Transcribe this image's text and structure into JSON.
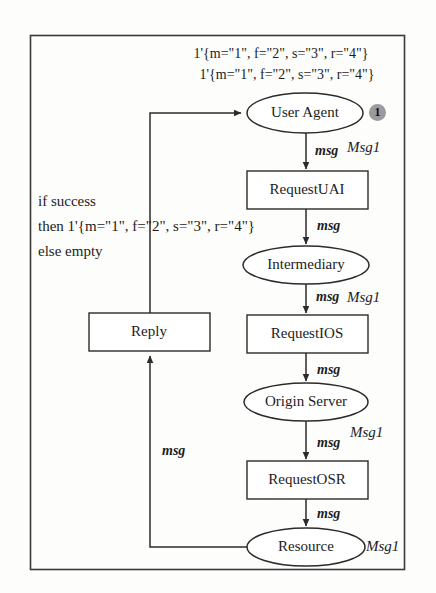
{
  "diagram": {
    "border_color": "#2a2a2a",
    "token_marker_color": "#9b9b9b",
    "initial_marking": {
      "line1": "1'{m=\"1\", f=\"2\", s=\"3\", r=\"4\"}",
      "line2": "1'{m=\"1\", f=\"2\", s=\"3\", r=\"4\"}"
    },
    "guard_annotation": {
      "line1": "if success",
      "line2": "then 1'{m=\"1\", f=\"2\", s=\"3\", r=\"4\"}",
      "line3": "else empty"
    },
    "places": [
      {
        "id": "user-agent",
        "label": "User Agent",
        "type_label": "Msg1",
        "token_count": "1"
      },
      {
        "id": "intermediary",
        "label": "Intermediary",
        "type_label": "Msg1",
        "token_count": ""
      },
      {
        "id": "origin-server",
        "label": "Origin Server",
        "type_label": "Msg1",
        "token_count": ""
      },
      {
        "id": "resource",
        "label": "Resource",
        "type_label": "Msg1",
        "token_count": ""
      }
    ],
    "transitions": [
      {
        "id": "request-uai",
        "label": "RequestUAI"
      },
      {
        "id": "request-ios",
        "label": "RequestIOS"
      },
      {
        "id": "request-osr",
        "label": "RequestOSR"
      },
      {
        "id": "reply",
        "label": "Reply"
      }
    ],
    "arc_labels": {
      "ua_to_uai": "msg",
      "uai_to_intermediary": "msg",
      "intermediary_to_ios": "msg",
      "ios_to_origin": "msg",
      "origin_to_osr": "msg",
      "osr_to_resource": "msg",
      "resource_to_reply": "msg"
    }
  }
}
